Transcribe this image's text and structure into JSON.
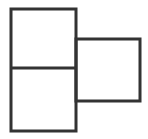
{
  "figure": {
    "background_color": "#FFFFFF",
    "stroke_color": "#333333",
    "stroke_width": 3,
    "canvas": {
      "width": 148,
      "height": 139
    },
    "shapes": [
      {
        "name": "left-tall-rectangle",
        "type": "rectangle",
        "label": "Left vertical rectangle (two stacked squares)",
        "x": 11,
        "y": 9,
        "width": 65,
        "height": 122,
        "fill": "none"
      },
      {
        "name": "right-square",
        "type": "rectangle",
        "label": "Right square",
        "x": 76,
        "y": 39,
        "width": 64,
        "height": 62,
        "fill": "none"
      }
    ],
    "dividers": [
      {
        "name": "horizontal-divider",
        "type": "line",
        "label": "Horizontal divider splitting left rectangle into two squares",
        "x1": 11,
        "y1": 68,
        "x2": 76,
        "y2": 68
      }
    ],
    "cells": [
      {
        "name": "top-left-square",
        "label": "Top left square"
      },
      {
        "name": "bottom-left-square",
        "label": "Bottom left square"
      },
      {
        "name": "right-square-cell",
        "label": "Right square"
      }
    ]
  }
}
